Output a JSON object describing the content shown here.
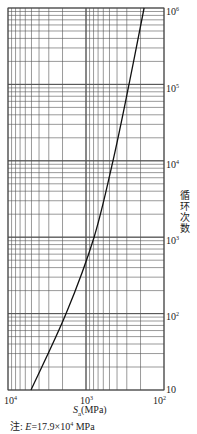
{
  "chart_data": {
    "type": "line",
    "title": "",
    "xlabel": "S_a(MPa)",
    "ylabel": "循环次数",
    "x_scale": "log",
    "y_scale": "log",
    "x_reversed": true,
    "xlim": [
      10000,
      100
    ],
    "ylim": [
      10,
      1000000
    ],
    "grid": true,
    "x_ticks": [
      "10^4",
      "10^3",
      "10^2"
    ],
    "y_ticks": [
      "10",
      "10^2",
      "10^3",
      "10^4",
      "10^5",
      "10^6"
    ],
    "series": [
      {
        "name": "design fatigue curve",
        "x": [
          5070,
          1800,
          788,
          451,
          281,
          180
        ],
        "y": [
          10,
          100,
          1000,
          10000,
          100000,
          1000000
        ]
      }
    ],
    "annotations": [
      "注: E=17.9×10^4 MPa"
    ]
  },
  "labels": {
    "ylabel": "循环次数",
    "xlabel_main": "S",
    "xlabel_sub": "a",
    "xlabel_unit": "(MPa)",
    "note_prefix": "注:",
    "note_e": "E",
    "note_value": "=17.9×10",
    "note_exp": "4",
    "note_unit": " MPa",
    "x_tick_base": "10",
    "x_tick_exps": [
      "4",
      "3",
      "2"
    ],
    "y_tick_10": "10",
    "y_tick_exps": [
      "2",
      "3",
      "4",
      "5",
      "6"
    ]
  }
}
